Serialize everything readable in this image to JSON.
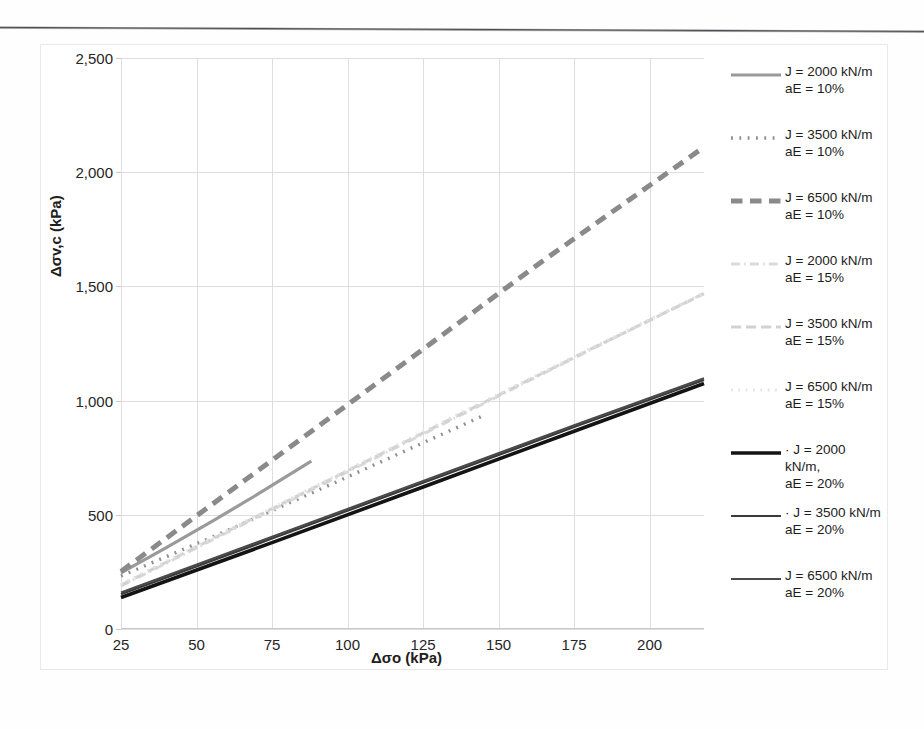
{
  "chart_data": {
    "type": "line",
    "title": "",
    "xlabel": "Δσo (kPa)",
    "ylabel": "Δσv,c (kPa)",
    "xlim": [
      25,
      218
    ],
    "ylim": [
      0,
      2500
    ],
    "xticks": [
      25,
      50,
      75,
      100,
      125,
      150,
      175,
      200
    ],
    "yticks": [
      0,
      500,
      1000,
      1500,
      2000,
      2500
    ],
    "ytick_labels": [
      "0",
      "500",
      "1,000",
      "1,500",
      "2,000",
      "2,500"
    ],
    "xtick_labels": [
      "25",
      "50",
      "75",
      "100",
      "125",
      "150",
      "175",
      "200"
    ],
    "grid": true,
    "legend_position": "right",
    "series": [
      {
        "name": "J = 2000 kN/m\naE = 10%",
        "J": 2000,
        "aE": "10%",
        "style": "solid",
        "color": "#9a9a9a",
        "width": 3.2,
        "x": [
          25,
          40,
          55,
          70,
          88
        ],
        "y": [
          246,
          356,
          470,
          588,
          735
        ]
      },
      {
        "name": "J = 3500 kN/m\naE = 10%",
        "J": 3500,
        "aE": "10%",
        "style": "dotted",
        "color": "#8f8f8f",
        "width": 3.4,
        "x": [
          25,
          60,
          95,
          130,
          146
        ],
        "y": [
          232,
          430,
          636,
          845,
          940
        ]
      },
      {
        "name": "J = 6500 kN/m\naE = 10%",
        "J": 6500,
        "aE": "10%",
        "style": "dashed",
        "color": "#8a8a8a",
        "width": 5.0,
        "x": [
          25,
          70,
          115,
          165,
          218
        ],
        "y": [
          252,
          690,
          1128,
          1615,
          2110
        ]
      },
      {
        "name": "J = 2000 kN/m\naE = 15%",
        "J": 2000,
        "aE": "15%",
        "style": "dashdot",
        "color": "#dadada",
        "width": 3.0,
        "x": [
          25,
          80,
          135,
          180,
          218
        ],
        "y": [
          188,
          555,
          920,
          1220,
          1470
        ]
      },
      {
        "name": "J = 3500 kN/m\naE = 15%",
        "J": 3500,
        "aE": "15%",
        "style": "longdash",
        "color": "#d2d2d2",
        "width": 3.0,
        "x": [
          25,
          80,
          135,
          180,
          218
        ],
        "y": [
          192,
          560,
          925,
          1222,
          1468
        ]
      },
      {
        "name": "J = 6500 kN/m\naE = 15%",
        "J": 6500,
        "aE": "15%",
        "style": "dotted",
        "color": "#e2e2e2",
        "width": 3.0,
        "x": [
          25,
          80,
          135,
          180,
          218
        ],
        "y": [
          196,
          564,
          930,
          1226,
          1472
        ]
      },
      {
        "name": "J = 2000 kN/m,\naE = 20%",
        "J": 2000,
        "aE": "20%",
        "style": "solid",
        "color": "#141414",
        "width": 3.6,
        "x": [
          25,
          75,
          125,
          175,
          218
        ],
        "y": [
          138,
          378,
          622,
          866,
          1075
        ]
      },
      {
        "name": "J = 3500 kN/m\naE = 20%",
        "J": 3500,
        "aE": "20%",
        "style": "solid",
        "color": "#3a3a3a",
        "width": 2.2,
        "x": [
          25,
          75,
          125,
          175,
          218
        ],
        "y": [
          152,
          396,
          640,
          884,
          1090
        ]
      },
      {
        "name": "J = 6500 kN/m\naE = 20%",
        "J": 6500,
        "aE": "20%",
        "style": "solid",
        "color": "#4a4a4a",
        "width": 2.0,
        "x": [
          25,
          75,
          125,
          175,
          218
        ],
        "y": [
          160,
          404,
          648,
          892,
          1098
        ]
      }
    ]
  },
  "legend": {
    "items": [
      {
        "label": "J = 2000 kN/m\naE = 10%"
      },
      {
        "label": "J = 3500 kN/m\naE = 10%"
      },
      {
        "label": "J = 6500 kN/m\naE = 10%"
      },
      {
        "label": "J = 2000 kN/m\naE = 15%"
      },
      {
        "label": "J = 3500 kN/m\naE = 15%"
      },
      {
        "label": "J = 6500 kN/m\naE = 15%"
      },
      {
        "label": "· J = 2000 kN/m,\naE = 20%"
      },
      {
        "label": "· J = 3500 kN/m\naE = 20%"
      },
      {
        "label": "J = 6500 kN/m\naE = 20%"
      }
    ]
  }
}
